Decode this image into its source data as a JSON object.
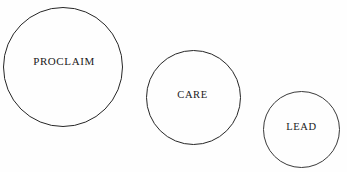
{
  "diagram": {
    "type": "circles",
    "background_color": "#fefefe",
    "stroke_color": "#262626",
    "text_color": "#1a1a1a",
    "canvas": {
      "width": 347,
      "height": 172
    },
    "nodes": [
      {
        "id": "proclaim",
        "label": "PROCLAIM",
        "shape": "circle",
        "center_x": 63,
        "center_y": 67,
        "diameter": 120,
        "order": 1
      },
      {
        "id": "care",
        "label": "CARE",
        "shape": "circle",
        "center_x": 193,
        "center_y": 97,
        "diameter": 95,
        "order": 2
      },
      {
        "id": "lead",
        "label": "LEAD",
        "shape": "circle",
        "center_x": 301,
        "center_y": 129,
        "diameter": 77,
        "order": 3
      }
    ]
  }
}
